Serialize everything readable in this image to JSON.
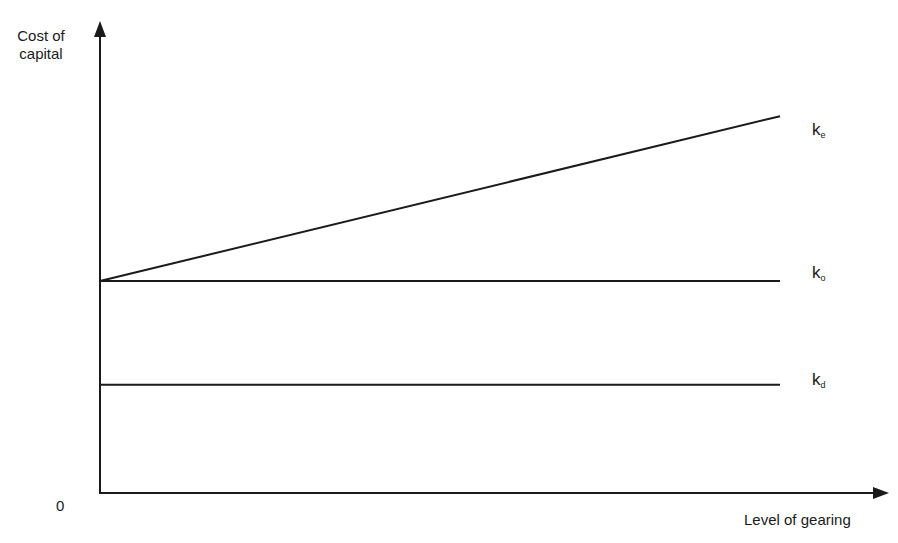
{
  "chart_data": {
    "type": "line",
    "title": "",
    "xlabel": "Level of gearing",
    "ylabel": "Cost of capital",
    "origin_label": "0",
    "grid": false,
    "legend": "inline-right",
    "x": [
      0,
      1
    ],
    "series": [
      {
        "name": "ke",
        "main": "k",
        "sub": "e",
        "values": [
          0.45,
          0.8
        ],
        "description": "cost of equity rises with gearing"
      },
      {
        "name": "ko",
        "main": "k",
        "sub": "o",
        "values": [
          0.45,
          0.45
        ],
        "description": "overall cost of capital constant"
      },
      {
        "name": "kd",
        "main": "k",
        "sub": "d",
        "values": [
          0.23,
          0.23
        ],
        "description": "cost of debt constant"
      }
    ],
    "axis_ranges": {
      "x": [
        0,
        1.1
      ],
      "y": [
        0,
        1
      ]
    }
  },
  "labels": {
    "y_axis_line1": "Cost of",
    "y_axis_line2": "capital",
    "x_axis": "Level of gearing",
    "origin": "0",
    "ke_main": "k",
    "ke_sub": "e",
    "ko_main": "k",
    "ko_sub": "o",
    "kd_main": "k",
    "kd_sub": "d"
  }
}
